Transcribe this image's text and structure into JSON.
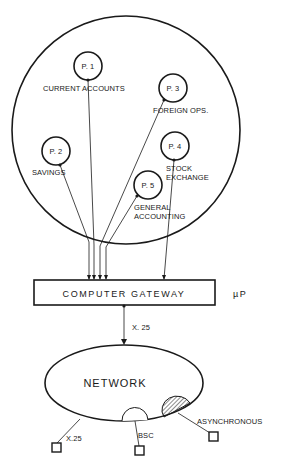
{
  "diagram": {
    "processes": [
      {
        "id": "P. 1",
        "label": [
          "CURRENT  ACCOUNTS"
        ]
      },
      {
        "id": "P. 2",
        "label": [
          "SAVINGS"
        ]
      },
      {
        "id": "P. 3",
        "label": [
          "FOREIGN  OPS."
        ]
      },
      {
        "id": "P. 4",
        "label": [
          "STOCK",
          "EXCHANGE"
        ]
      },
      {
        "id": "P. 5",
        "label": [
          "GENERAL",
          "ACCOUNTING"
        ]
      }
    ],
    "gateway": {
      "label": "COMPUTER  GATEWAY",
      "side_label": "µP"
    },
    "link": {
      "label": "X. 25"
    },
    "network": {
      "label": "NETWORK",
      "terminals": [
        {
          "label": "X.25"
        },
        {
          "label": "BSC"
        },
        {
          "label": "ASYNCHRONOUS"
        }
      ]
    }
  }
}
